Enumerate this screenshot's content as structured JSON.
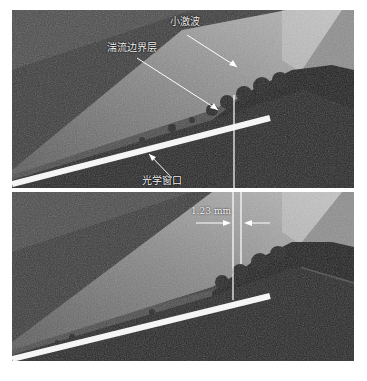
{
  "figure": {
    "panels": [
      {
        "id": "top",
        "labels": {
          "shock": "小激波",
          "boundary_layer": "湍流边界层",
          "window": "光学窗口"
        }
      },
      {
        "id": "bottom",
        "labels": {
          "thickness": "1.23 mm"
        }
      }
    ],
    "colors": {
      "background": "#2a2a2a",
      "light_band": "#8a8a8a",
      "window_bar": "#f5f5f5",
      "annotation": "#ffffff"
    }
  }
}
